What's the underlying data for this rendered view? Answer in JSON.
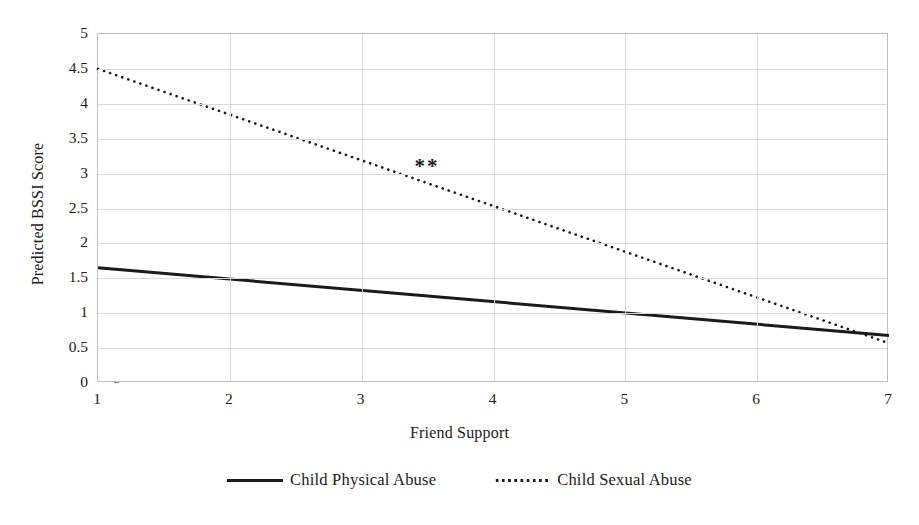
{
  "chart_data": {
    "type": "line",
    "title": "",
    "xlabel": "Friend Support",
    "ylabel": "Predicted BSSI Score",
    "xlim": [
      1,
      7
    ],
    "ylim": [
      0,
      5
    ],
    "grid": true,
    "legend_position": "bottom-center",
    "x_ticks": [
      "1",
      "2",
      "3",
      "4",
      "5",
      "6",
      "7"
    ],
    "y_ticks": [
      "0",
      "0.5",
      "1",
      "1.5",
      "2",
      "2.5",
      "3",
      "3.5",
      "4",
      "4.5",
      "5"
    ],
    "x": [
      1,
      7
    ],
    "series": [
      {
        "name": "Child Physical Abuse",
        "style": "solid",
        "color": "#1a1a1a",
        "values": [
          1.65,
          0.68
        ]
      },
      {
        "name": "Child Sexual Abuse",
        "style": "dotted",
        "color": "#1a1a1a",
        "values": [
          4.5,
          0.57
        ]
      }
    ],
    "annotations": [
      {
        "text": "**",
        "x": 3.5,
        "y": 3.1,
        "series": "Child Sexual Abuse"
      }
    ]
  },
  "legend": {
    "items": [
      {
        "label": "Child Physical Abuse",
        "marker": "solid-line-icon"
      },
      {
        "label": "Child Sexual Abuse",
        "marker": "dotted-line-icon"
      }
    ]
  }
}
